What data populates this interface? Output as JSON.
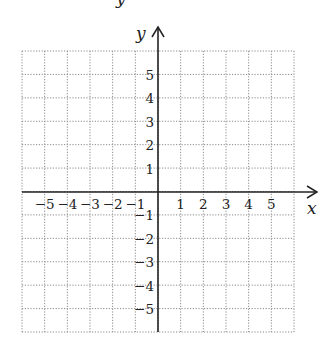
{
  "figure": {
    "type": "coordinate-plane",
    "partial_top_label": "y",
    "x_axis": {
      "label": "x",
      "ticks": [
        "-5",
        "-4",
        "-3",
        "-2",
        "-1",
        "1",
        "2",
        "3",
        "4",
        "5"
      ]
    },
    "y_axis": {
      "label": "y",
      "ticks": [
        "5",
        "4",
        "3",
        "2",
        "1",
        "-1",
        "-2",
        "-3",
        "-4",
        "-5"
      ]
    },
    "grid": {
      "columns": 12,
      "rows": 12,
      "style": "dotted",
      "color": "#8a8a8a"
    },
    "axis_color": "#222222"
  },
  "geometry": {
    "left": 22,
    "right": 294,
    "top": 51,
    "bottom": 332,
    "origin_x": 158,
    "origin_y": 192,
    "x_arrow_tip": 317,
    "y_arrow_tip": 27
  }
}
